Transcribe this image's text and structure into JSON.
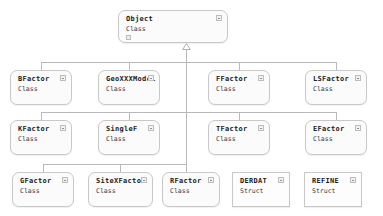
{
  "diagram": {
    "type": "uml-class-hierarchy",
    "background": "#ffffff",
    "box_fill": "#fbfbfb",
    "box_border": "#c8c8c8",
    "line_color": "#b9b9b9",
    "relationship": "generalization"
  },
  "root": {
    "title": "Object",
    "stereotype": "Class",
    "collapse_icon": "collapse-box-icon",
    "member_icon": "member-square-icon",
    "x": 118,
    "y": 10,
    "w": 110,
    "h": 33
  },
  "rows": [
    {
      "y": 70,
      "h": 35,
      "nodes": [
        {
          "title": "BFactor",
          "stereotype": "Class",
          "x": 10,
          "w": 62,
          "shape": "rounded",
          "connected": true
        },
        {
          "title": "GeoXXXModel",
          "stereotype": "Class",
          "x": 98,
          "w": 62,
          "shape": "rounded",
          "connected": true
        },
        {
          "title": "FFactor",
          "stereotype": "Class",
          "x": 208,
          "w": 62,
          "shape": "rounded",
          "connected": true
        },
        {
          "title": "LSFactor",
          "stereotype": "Class",
          "x": 305,
          "w": 62,
          "shape": "rounded",
          "connected": true
        }
      ]
    },
    {
      "y": 120,
      "h": 35,
      "nodes": [
        {
          "title": "KFactor",
          "stereotype": "Class",
          "x": 10,
          "w": 62,
          "shape": "rounded",
          "connected": true
        },
        {
          "title": "SingleF",
          "stereotype": "Class",
          "x": 98,
          "w": 62,
          "shape": "rounded",
          "connected": true
        },
        {
          "title": "TFactor",
          "stereotype": "Class",
          "x": 208,
          "w": 62,
          "shape": "rounded",
          "connected": true
        },
        {
          "title": "EFactor",
          "stereotype": "Class",
          "x": 305,
          "w": 62,
          "shape": "rounded",
          "connected": true
        }
      ]
    },
    {
      "y": 172,
      "h": 35,
      "nodes": [
        {
          "title": "GFactor",
          "stereotype": "Class",
          "x": 12,
          "w": 62,
          "shape": "rounded",
          "connected": true
        },
        {
          "title": "SiteXFactor",
          "stereotype": "Class",
          "x": 88,
          "w": 65,
          "shape": "rounded",
          "connected": true
        },
        {
          "title": "RFactor",
          "stereotype": "Class",
          "x": 162,
          "w": 58,
          "shape": "rounded",
          "connected": true
        },
        {
          "title": "DERDAT",
          "stereotype": "Struct",
          "x": 232,
          "w": 58,
          "shape": "square",
          "connected": false
        },
        {
          "title": "REFINE",
          "stereotype": "Struct",
          "x": 304,
          "w": 58,
          "shape": "square",
          "connected": false
        }
      ]
    }
  ],
  "connectors": {
    "trunk_x": 186,
    "trunk_top": 49,
    "trunk_bottom": 166,
    "arrow": "inheritance-triangle-icon",
    "branch_ys": [
      62,
      112,
      164
    ],
    "drop_height": 8
  }
}
